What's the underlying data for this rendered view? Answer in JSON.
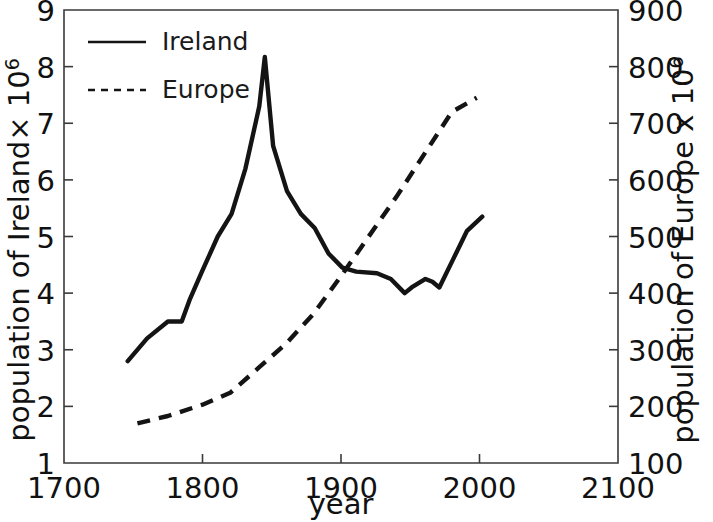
{
  "chart_data": {
    "type": "line",
    "title": "",
    "xlabel": "year",
    "ylabel_left": "population of Ireland× 10",
    "ylabel_left_exponent": "6",
    "ylabel_right": "population of Europe x 10",
    "ylabel_right_exponent": "6",
    "xlim": [
      1700,
      2100
    ],
    "ylim_left": [
      1,
      9
    ],
    "ylim_right": [
      100,
      900
    ],
    "xticks": [
      1700,
      1800,
      1900,
      2000,
      2100
    ],
    "xtick_labels": [
      "1700",
      "1800",
      "1900",
      "2000",
      "2100"
    ],
    "yticks_left": [
      1,
      2,
      3,
      4,
      5,
      6,
      7,
      8,
      9
    ],
    "ytick_labels_left": [
      "1",
      "2",
      "3",
      "4",
      "5",
      "6",
      "7",
      "8",
      "9"
    ],
    "yticks_right": [
      100,
      200,
      300,
      400,
      500,
      600,
      700,
      800,
      900
    ],
    "ytick_labels_right": [
      "100",
      "200",
      "300",
      "400",
      "500",
      "600",
      "700",
      "800",
      "900"
    ],
    "grid": false,
    "legend_position": "upper left",
    "series": [
      {
        "name": "Ireland",
        "label": "Ireland",
        "axis": "left",
        "style": "solid",
        "color": "#141414",
        "units": "millions",
        "x": [
          1746,
          1760,
          1775,
          1785,
          1791,
          1800,
          1811,
          1821,
          1831,
          1841,
          1845,
          1851,
          1861,
          1871,
          1881,
          1891,
          1901,
          1911,
          1926,
          1936,
          1946,
          1951,
          1961,
          1966,
          1971,
          1981,
          1991,
          2002
        ],
        "y": [
          2.8,
          3.2,
          3.5,
          3.5,
          3.9,
          4.4,
          5.0,
          5.4,
          6.2,
          7.3,
          8.17,
          6.6,
          5.8,
          5.4,
          5.15,
          4.7,
          4.45,
          4.38,
          4.35,
          4.25,
          4.0,
          4.1,
          4.25,
          4.2,
          4.1,
          4.6,
          5.1,
          5.35
        ]
      },
      {
        "name": "Europe",
        "label": "Europe",
        "axis": "right",
        "style": "dashed",
        "color": "#141414",
        "units": "millions",
        "x": [
          1753,
          1775,
          1800,
          1820,
          1840,
          1860,
          1880,
          1900,
          1920,
          1940,
          1960,
          1980,
          1998
        ],
        "y": [
          170,
          183,
          203,
          224,
          267,
          310,
          363,
          430,
          500,
          570,
          645,
          720,
          745
        ]
      }
    ]
  },
  "legend": {
    "entries": [
      {
        "label": "Ireland",
        "style": "solid"
      },
      {
        "label": "Europe",
        "style": "dashed"
      }
    ]
  }
}
